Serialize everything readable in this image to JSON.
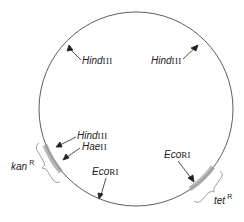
{
  "diagram": {
    "type": "plasmid map",
    "sites": [
      {
        "id": "hind1",
        "italic": "Hind",
        "roman": "III",
        "x": 81,
        "y": 56
      },
      {
        "id": "hind2",
        "italic": "Hind",
        "roman": "III",
        "x": 151,
        "y": 56
      },
      {
        "id": "hind3",
        "italic": "Hind",
        "roman": "III",
        "x": 77,
        "y": 133
      },
      {
        "id": "hae",
        "italic": "Hae",
        "roman": "II",
        "x": 82,
        "y": 144
      },
      {
        "id": "eco1",
        "italic": "Eco",
        "roman": "RI",
        "x": 91,
        "y": 168
      },
      {
        "id": "eco2",
        "italic": "Eco",
        "roman": "RI",
        "x": 164,
        "y": 150
      }
    ],
    "genes": [
      {
        "id": "kan",
        "name": "kan",
        "sup": "R"
      },
      {
        "id": "tet",
        "name": "tet",
        "sup": "R"
      }
    ]
  }
}
